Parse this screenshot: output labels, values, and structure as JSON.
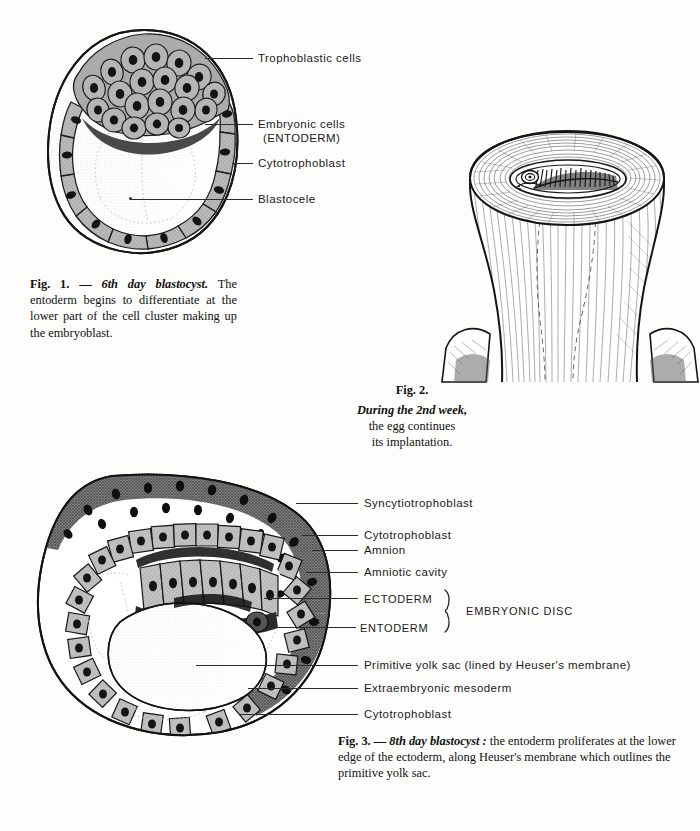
{
  "page": {
    "background_color": "#fdfdfb",
    "ink_color": "#111111"
  },
  "figure1": {
    "name": "6th day blastocyst diagram",
    "labels": [
      {
        "id": "trophoblastic-cells",
        "text": "Trophoblastic cells"
      },
      {
        "id": "embryonic-cells",
        "text": "Embryonic cells",
        "text2": "(ENTODERM)"
      },
      {
        "id": "cytotrophoblast",
        "text": "Cytotrophoblast"
      },
      {
        "id": "blastocele",
        "text": "Blastocele"
      }
    ],
    "caption": {
      "fignum": "Fig. 1. — ",
      "title": "6th day blastocyst.",
      "body": " The entoderm begins to differentiate at the lower part of the cell cluster making up the embryoblast."
    }
  },
  "figure2": {
    "name": "implantation of the egg in the uterine wall",
    "caption": {
      "fignum": "Fig. 2.",
      "line1": "During the 2nd week,",
      "line2": "the egg continues",
      "line3": "its implantation."
    }
  },
  "figure3": {
    "name": "8th day blastocyst diagram",
    "labels": [
      {
        "id": "syncytiotrophoblast",
        "text": "Syncytiotrophoblast"
      },
      {
        "id": "cytotrophoblast-upper",
        "text": "Cytotrophoblast"
      },
      {
        "id": "amnion",
        "text": "Amnion"
      },
      {
        "id": "amniotic-cavity",
        "text": "Amniotic cavity"
      },
      {
        "id": "ectoderm",
        "text": "ECTODERM"
      },
      {
        "id": "entoderm",
        "text": "ENTODERM"
      },
      {
        "id": "primitive-yolk-sac",
        "text": "Primitive yolk sac (lined by Heuser's membrane)"
      },
      {
        "id": "extraembryonic-mesoderm",
        "text": "Extraembryonic mesoderm"
      },
      {
        "id": "cytotrophoblast-lower",
        "text": "Cytotrophoblast"
      }
    ],
    "bracket_label": "EMBRYONIC  DISC",
    "caption": {
      "fignum": "Fig. 3. — ",
      "title": "8th day blastocyst :",
      "body": " the entoderm proliferates at the lower edge of the ectoderm, along Heuser's membrane which outlines the primitive yolk sac."
    }
  }
}
